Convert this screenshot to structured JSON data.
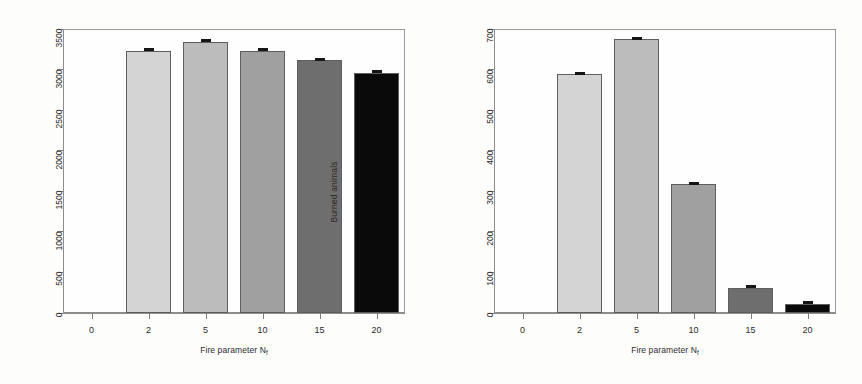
{
  "figure": {
    "background": "#fdfdfc",
    "bar_border_color": "#5e5e5e",
    "axis_color": "#8d8d8d",
    "error_bar_color": "#161616"
  },
  "chart_data": [
    {
      "type": "bar",
      "panel": "left",
      "title": "",
      "xlabel": "Fire parameter N",
      "xlabel_sub": "f",
      "ylabel": "Burned trees",
      "categories": [
        "0",
        "2",
        "5",
        "10",
        "15",
        "20"
      ],
      "values": [
        0,
        3235,
        3345,
        3235,
        3115,
        2960
      ],
      "errors": [
        0,
        18,
        16,
        17,
        15,
        10
      ],
      "colors": [
        "#ffffff",
        "#d4d4d4",
        "#bcbcbc",
        "#a0a0a0",
        "#6e6e6e",
        "#0a0a0a"
      ],
      "ylim": [
        0,
        3500
      ],
      "yticks": [
        0,
        500,
        1000,
        1500,
        2000,
        2500,
        3000,
        3500
      ],
      "ytick_labels": [
        "0",
        "500",
        "1000",
        "1500",
        "2000",
        "2500",
        "3000",
        "3500"
      ],
      "grid": false,
      "legend": "none"
    },
    {
      "type": "bar",
      "panel": "right",
      "title": "",
      "xlabel": "Fire parameter N",
      "xlabel_sub": "f",
      "ylabel": "Burned animals",
      "categories": [
        "0",
        "2",
        "5",
        "10",
        "15",
        "20"
      ],
      "values": [
        0,
        588,
        676,
        317,
        62,
        22
      ],
      "errors": [
        0,
        5,
        5,
        4,
        3,
        2
      ],
      "colors": [
        "#ffffff",
        "#d4d4d4",
        "#bcbcbc",
        "#a0a0a0",
        "#6e6e6e",
        "#0a0a0a"
      ],
      "ylim": [
        0,
        700
      ],
      "yticks": [
        0,
        100,
        200,
        300,
        400,
        500,
        600,
        700
      ],
      "ytick_labels": [
        "0",
        "100",
        "200",
        "300",
        "400",
        "500",
        "600",
        "700"
      ],
      "grid": false,
      "legend": "none"
    }
  ]
}
